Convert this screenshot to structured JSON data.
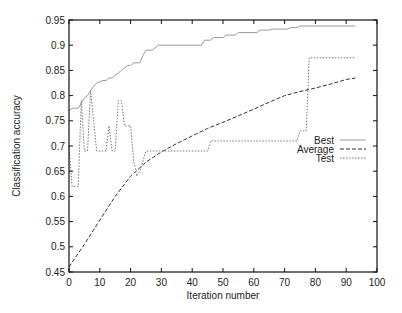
{
  "chart_data": {
    "type": "line",
    "title": "",
    "xlabel": "Iteration number",
    "ylabel": "Classification accuracy",
    "xlim": [
      0,
      100
    ],
    "ylim": [
      0.45,
      0.95
    ],
    "xticks": [
      0,
      10,
      20,
      30,
      40,
      50,
      60,
      70,
      80,
      90,
      100
    ],
    "yticks": [
      0.45,
      0.5,
      0.55,
      0.6,
      0.65,
      0.7,
      0.75,
      0.8,
      0.85,
      0.9,
      0.95
    ],
    "ytick_labels": [
      "0.45",
      "0.5",
      "0.55",
      "0.6",
      "0.65",
      "0.7",
      "0.75",
      "0.8",
      "0.85",
      "0.9",
      "0.95"
    ],
    "grid": false,
    "legend_position": "right-middle",
    "series": [
      {
        "name": "Best",
        "style": "solid",
        "color": "#9a9a9a",
        "x": [
          0,
          1,
          3,
          4,
          5,
          6,
          7,
          8,
          9,
          11,
          12,
          13,
          14,
          15,
          16,
          17,
          18,
          19,
          20,
          21,
          23,
          24,
          25,
          27,
          28,
          29,
          30,
          43,
          44,
          46,
          47,
          50,
          51,
          54,
          55,
          61,
          62,
          65,
          66,
          71,
          72,
          74,
          75,
          78,
          93
        ],
        "y": [
          0.77,
          0.775,
          0.775,
          0.785,
          0.795,
          0.8,
          0.81,
          0.818,
          0.825,
          0.83,
          0.83,
          0.835,
          0.835,
          0.84,
          0.845,
          0.85,
          0.855,
          0.86,
          0.86,
          0.865,
          0.865,
          0.88,
          0.89,
          0.89,
          0.895,
          0.9,
          0.9,
          0.9,
          0.91,
          0.91,
          0.915,
          0.915,
          0.92,
          0.92,
          0.925,
          0.925,
          0.93,
          0.93,
          0.932,
          0.932,
          0.935,
          0.935,
          0.938,
          0.938,
          0.938
        ]
      },
      {
        "name": "Average",
        "style": "dashed",
        "color": "#333333",
        "x": [
          0,
          5,
          10,
          15,
          20,
          25,
          30,
          35,
          40,
          45,
          50,
          55,
          60,
          65,
          70,
          75,
          80,
          85,
          90,
          93
        ],
        "y": [
          0.46,
          0.505,
          0.553,
          0.6,
          0.64,
          0.668,
          0.688,
          0.705,
          0.72,
          0.735,
          0.747,
          0.76,
          0.773,
          0.787,
          0.8,
          0.808,
          0.815,
          0.823,
          0.832,
          0.835
        ]
      },
      {
        "name": "Test",
        "style": "dotted",
        "color": "#777777",
        "x": [
          0,
          1,
          3,
          4,
          5,
          6,
          7,
          8,
          9,
          12,
          13,
          14,
          15,
          16,
          17,
          18,
          20,
          21,
          22,
          23,
          25,
          45,
          46,
          74,
          75,
          77,
          78,
          93
        ],
        "y": [
          0.7,
          0.62,
          0.62,
          0.79,
          0.69,
          0.69,
          0.81,
          0.75,
          0.69,
          0.69,
          0.74,
          0.69,
          0.69,
          0.79,
          0.79,
          0.74,
          0.74,
          0.67,
          0.64,
          0.65,
          0.69,
          0.69,
          0.71,
          0.71,
          0.73,
          0.73,
          0.875,
          0.875
        ]
      }
    ]
  }
}
